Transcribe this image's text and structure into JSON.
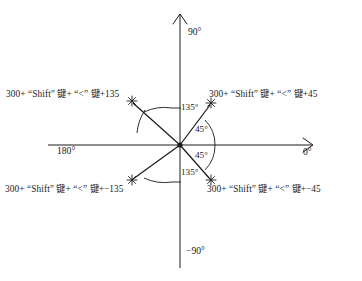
{
  "figure": {
    "type": "polar-angle-reference-diagram",
    "center": {
      "x": 180,
      "y": 145
    },
    "axes": {
      "positive_x_label": "0°",
      "negative_x_label": "180°",
      "positive_y_label": "90°",
      "negative_y_label": "−90°"
    },
    "angle_annotations": {
      "upper_left_arc": "135°",
      "upper_right_arc": "45°",
      "lower_right_arc": "45°",
      "lower_left_arc": "135°"
    },
    "rays": [
      {
        "quadrant": "upper-left",
        "angle_deg": 135,
        "tip": {
          "x": 131,
          "y": 101
        },
        "label": "300+ “Shift” 键+ “<” 键+135"
      },
      {
        "quadrant": "upper-right",
        "angle_deg": 45,
        "tip": {
          "x": 212,
          "y": 103
        },
        "label": "300+ “Shift” 键+ “<” 键+45"
      },
      {
        "quadrant": "lower-left",
        "angle_deg": -135,
        "tip": {
          "x": 131,
          "y": 180
        },
        "label": "300+ “Shift” 键+ “<” 键+−135"
      },
      {
        "quadrant": "lower-right",
        "angle_deg": -45,
        "tip": {
          "x": 212,
          "y": 180
        },
        "label": "300+ “Shift” 键+ “<” 键+−45"
      }
    ],
    "colors": {
      "stroke": "#1a1a1a",
      "background": "#ffffff"
    }
  }
}
